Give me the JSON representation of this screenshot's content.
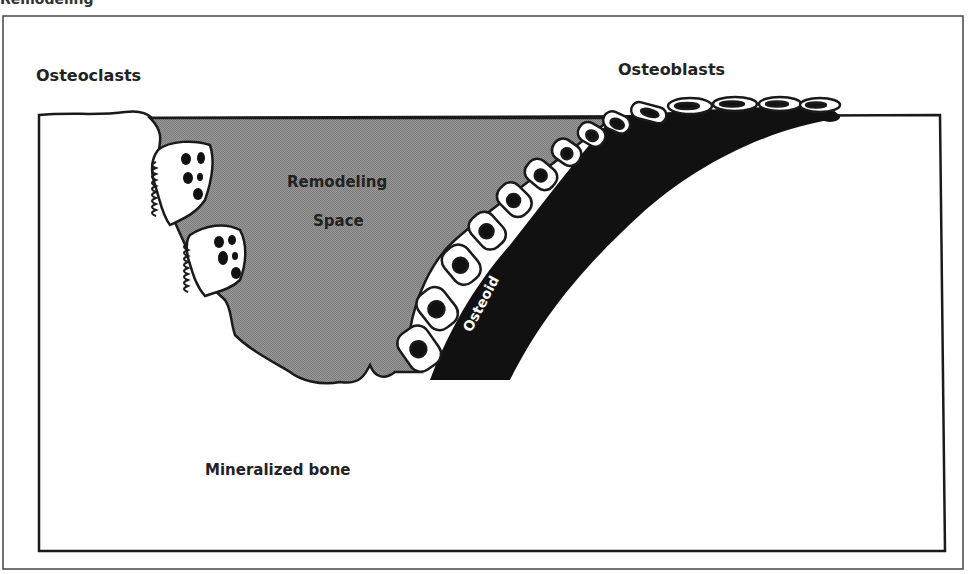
{
  "figure": {
    "top_fragment": "Remodeling",
    "labels": {
      "osteoclasts": "Osteoclasts",
      "osteoblasts": "Osteoblasts",
      "remodeling_space_line1": "Remodeling",
      "remodeling_space_line2": "Space",
      "osteoid": "Osteoid",
      "mineralized_bone": "Mineralized bone"
    },
    "colors": {
      "remodeling_space": "#8c8c8c",
      "osteoid": "#111111",
      "cell_fill": "#ffffff",
      "nucleus": "#111111",
      "outline": "#1a1a1a",
      "frame": "#333333"
    }
  }
}
